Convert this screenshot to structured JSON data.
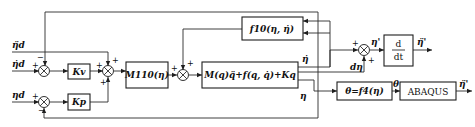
{
  "diagram": {
    "type": "control-block-diagram",
    "inputs": {
      "eta_dd": "η̈d",
      "eta_d_dot": "η̇d",
      "eta_d": "ηd"
    },
    "blocks": {
      "kv": "Kv",
      "kp": "Kp",
      "m110": "M110(η)",
      "plant": "M(q)q̈+f(q, q̇)+Kq",
      "f10": "f10(η, η̇)",
      "ddt_num": "d",
      "ddt_den": "dt",
      "f4": "θ=f4(η)",
      "abaqus": "ABAQUS"
    },
    "signals": {
      "eta_dot": "η̇",
      "eta": "η",
      "d_eta": "dη",
      "eta_prime": "η'",
      "eta_ddot_prime_1": "η̈'",
      "theta": "θ",
      "eta_ddot_prime_2": "η̈'"
    },
    "signs": {
      "s1_top": "−",
      "s1_left": "+",
      "s2_left": "+",
      "s2_bottom": "−",
      "s3_left": "+",
      "s3_top": "+",
      "s3_bottom": "+",
      "s4_left": "+",
      "s4_top": "+",
      "s5_left": "+",
      "s5_bottom": "+"
    }
  }
}
